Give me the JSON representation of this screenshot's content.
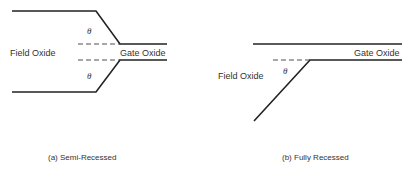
{
  "diagram_a": {
    "field_oxide_label": "Field Oxide",
    "gate_oxide_label": "Gate Oxide",
    "angle_top": "θ",
    "angle_bottom": "θ",
    "caption": "(a)  Semi-Recessed"
  },
  "diagram_b": {
    "field_oxide_label": "Field Oxide",
    "gate_oxide_label": "Gate Oxide",
    "angle": "θ",
    "caption": "(b)  Fully Recessed"
  }
}
